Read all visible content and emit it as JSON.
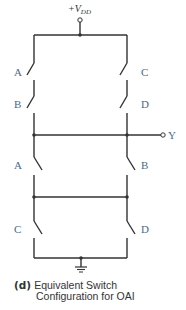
{
  "diagram": {
    "supply_label": "+V",
    "supply_subscript": "DD",
    "output_label": "Y",
    "pullup": {
      "left_switches": [
        "A",
        "B"
      ],
      "right_switches": [
        "C",
        "D"
      ]
    },
    "pulldown": {
      "upper_switches": [
        "A",
        "B"
      ],
      "lower_switches": [
        "C",
        "D"
      ]
    },
    "caption": {
      "tag": "(d)",
      "line1": "Equivalent Switch",
      "line2": "Configuration for OAI"
    },
    "colors": {
      "wire": "#333333",
      "label": "#4a6a8a"
    }
  }
}
